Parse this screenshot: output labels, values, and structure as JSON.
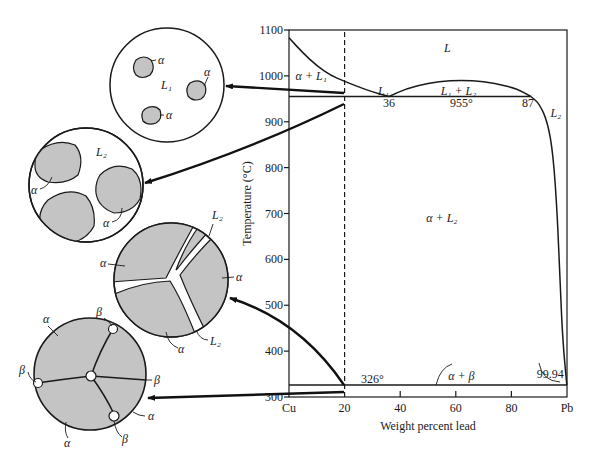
{
  "chart_data": {
    "type": "line",
    "title": "",
    "xlabel": "Weight percent lead",
    "ylabel": "Temperature (°C)",
    "xlim": [
      0,
      100
    ],
    "ylim": [
      300,
      1100
    ],
    "x_ticks": [
      {
        "value": 0,
        "label": "Cu"
      },
      {
        "value": 20,
        "label": "20"
      },
      {
        "value": 40,
        "label": "40"
      },
      {
        "value": 60,
        "label": "60"
      },
      {
        "value": 80,
        "label": "80"
      },
      {
        "value": 100,
        "label": "Pb"
      }
    ],
    "y_ticks": [
      {
        "value": 1100,
        "label": "1100"
      },
      {
        "value": 1000,
        "label": "1000"
      },
      {
        "value": 900,
        "label": "900"
      },
      {
        "value": 800,
        "label": "800"
      },
      {
        "value": 700,
        "label": "700"
      },
      {
        "value": 600,
        "label": "600"
      },
      {
        "value": 500,
        "label": "500"
      },
      {
        "value": 400,
        "label": "400"
      },
      {
        "value": 300,
        "label": "300"
      }
    ],
    "series": [
      {
        "name": "liquidus-cu-side",
        "points": [
          [
            0,
            1083
          ],
          [
            5,
            1050
          ],
          [
            10,
            1022
          ],
          [
            15,
            1001
          ],
          [
            20,
            988
          ],
          [
            25,
            976
          ],
          [
            30,
            965
          ],
          [
            36,
            955
          ]
        ]
      },
      {
        "name": "miscibility-dome",
        "points": [
          [
            36,
            955
          ],
          [
            42,
            972
          ],
          [
            50,
            984
          ],
          [
            58,
            990
          ],
          [
            66,
            990
          ],
          [
            74,
            984
          ],
          [
            82,
            972
          ],
          [
            87,
            955
          ]
        ]
      },
      {
        "name": "liquidus-pb-side",
        "points": [
          [
            87,
            955
          ],
          [
            90,
            940
          ],
          [
            93,
            900
          ],
          [
            95,
            830
          ],
          [
            96.5,
            700
          ],
          [
            97.5,
            550
          ],
          [
            98.5,
            420
          ],
          [
            99.94,
            326
          ]
        ]
      },
      {
        "name": "monotectic-isotherm",
        "points": [
          [
            0,
            955
          ],
          [
            87,
            955
          ]
        ]
      },
      {
        "name": "eutectic-isotherm",
        "points": [
          [
            0,
            326
          ],
          [
            99.94,
            326
          ]
        ]
      },
      {
        "name": "alloy-composition-line",
        "style": "dashed",
        "points": [
          [
            20,
            300
          ],
          [
            20,
            1100
          ]
        ]
      }
    ],
    "annotations": [
      {
        "text": "L",
        "x": 57,
        "y": 1060
      },
      {
        "text": "α + L₁",
        "x": 8,
        "y": 1000
      },
      {
        "text": "L₁",
        "x": 34,
        "y": 967
      },
      {
        "text": "L₁ + L₂",
        "x": 61,
        "y": 967
      },
      {
        "text": "36",
        "x": 36,
        "y": 940
      },
      {
        "text": "955°",
        "x": 62,
        "y": 940
      },
      {
        "text": "87",
        "x": 86,
        "y": 940
      },
      {
        "text": "L₂",
        "x": 96,
        "y": 918
      },
      {
        "text": "α + L₂",
        "x": 55,
        "y": 690
      },
      {
        "text": "326°",
        "x": 30,
        "y": 340
      },
      {
        "text": "α + β",
        "x": 62,
        "y": 345
      },
      {
        "text": "99.94",
        "x": 94,
        "y": 350
      }
    ]
  },
  "microstructures": [
    {
      "id": "above-monotectic",
      "labels": {
        "matrix": "L₁",
        "grain": "α"
      }
    },
    {
      "id": "below-monotectic",
      "labels": {
        "matrix": "L₂",
        "grain": "α"
      }
    },
    {
      "id": "cooling-in-alpha-plus-L2",
      "labels": {
        "liquid": "L₂",
        "grain": "α"
      }
    },
    {
      "id": "below-eutectic",
      "labels": {
        "grain": "α",
        "second_phase": "β"
      }
    }
  ]
}
